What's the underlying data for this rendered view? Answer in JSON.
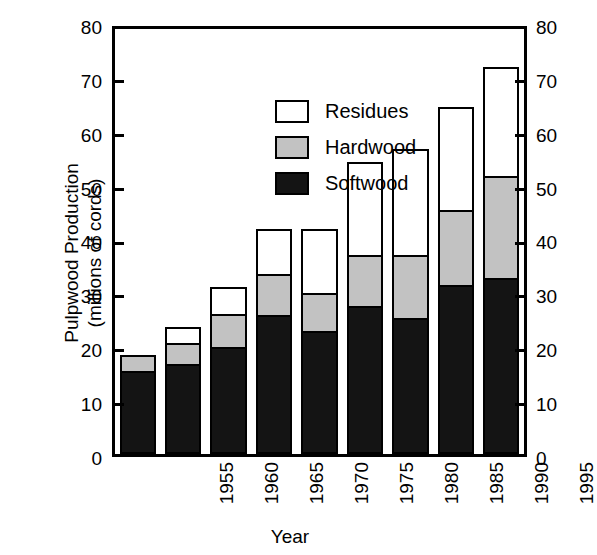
{
  "chart_data": {
    "type": "bar",
    "subtype": "stacked-bar",
    "title": "",
    "xlabel": "Year",
    "ylabel": "Pulpwood Production\n(millions of cords)",
    "ylabel_line1": "Pulpwood Production",
    "ylabel_line2": "(millions of cords)",
    "categories": [
      "1955",
      "1960",
      "1965",
      "1970",
      "1975",
      "1980",
      "1985",
      "1990",
      "1995"
    ],
    "series": [
      {
        "name": "Softwood",
        "color": "#141414",
        "values": [
          15.3,
          16.5,
          19.7,
          25.8,
          22.8,
          27.5,
          25.2,
          31.5,
          32.7
        ]
      },
      {
        "name": "Hardwood",
        "color": "#c2c2c2",
        "values": [
          3.0,
          4.0,
          6.3,
          7.7,
          7.2,
          9.5,
          11.8,
          14.0,
          19.3
        ]
      },
      {
        "name": "Residues",
        "color": "#ffffff",
        "values": [
          0.0,
          3.0,
          5.0,
          8.5,
          12.0,
          17.5,
          20.0,
          19.5,
          20.5
        ]
      }
    ],
    "totals": [
      18.3,
      23.5,
      31.0,
      42.0,
      42.0,
      54.5,
      57.0,
      65.0,
      72.5
    ],
    "stack_order": [
      "Softwood",
      "Hardwood",
      "Residues"
    ],
    "ylim": [
      0,
      80
    ],
    "yticks": [
      0,
      10,
      20,
      30,
      40,
      50,
      60,
      70,
      80
    ],
    "ytick_labels": [
      "0",
      "10",
      "20",
      "30",
      "40",
      "50",
      "60",
      "70",
      "80"
    ],
    "grid": false,
    "legend_position": "upper-left-inside",
    "legend_entries": [
      "Residues",
      "Hardwood",
      "Softwood"
    ],
    "axes": {
      "left_axis": true,
      "right_axis": true,
      "right_axis_mirrors_left": true,
      "frame": true
    }
  }
}
